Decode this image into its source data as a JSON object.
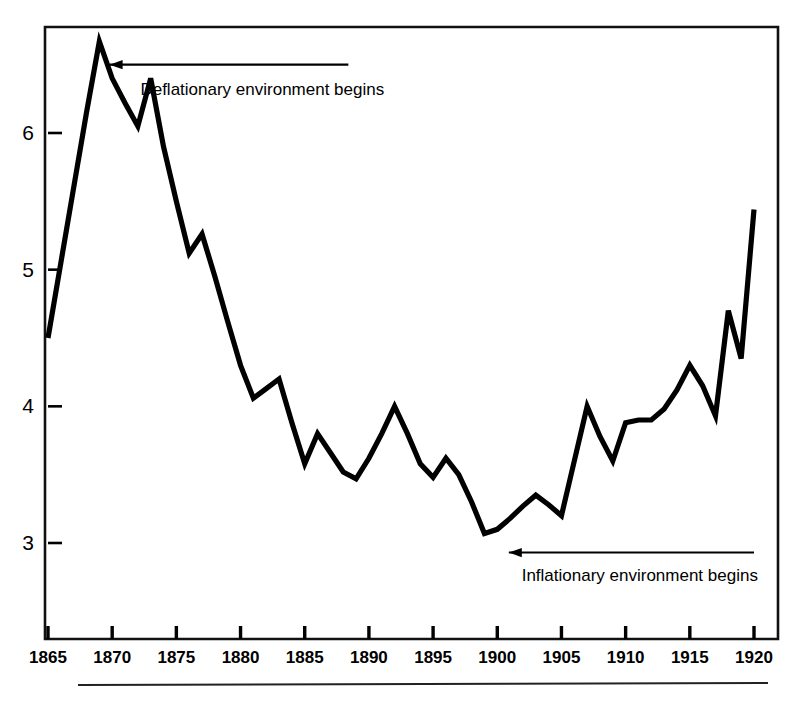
{
  "chart_data": {
    "type": "line",
    "title": "",
    "subtitle": "",
    "xlabel": "",
    "ylabel": "",
    "xlim": [
      1865,
      1920.5
    ],
    "ylim": [
      2.35,
      6.85
    ],
    "grid": false,
    "legend": "none",
    "line_color": "#000000",
    "x": [
      1865,
      1866,
      1867,
      1868,
      1869,
      1870,
      1871,
      1872,
      1873,
      1874,
      1875,
      1876,
      1877,
      1878,
      1879,
      1880,
      1881,
      1882,
      1883,
      1884,
      1885,
      1886,
      1887,
      1888,
      1889,
      1890,
      1891,
      1892,
      1893,
      1894,
      1895,
      1896,
      1897,
      1898,
      1899,
      1900,
      1901,
      1902,
      1903,
      1904,
      1905,
      1906,
      1907,
      1908,
      1909,
      1910,
      1911,
      1912,
      1913,
      1914,
      1915,
      1916,
      1917,
      1918,
      1919,
      1920
    ],
    "y": [
      4.5,
      5.05,
      5.6,
      6.15,
      6.67,
      6.4,
      6.22,
      6.05,
      6.4,
      5.9,
      5.5,
      5.12,
      5.26,
      4.95,
      4.62,
      4.3,
      4.06,
      4.13,
      4.2,
      3.88,
      3.58,
      3.8,
      3.66,
      3.52,
      3.47,
      3.62,
      3.8,
      4.0,
      3.8,
      3.58,
      3.48,
      3.62,
      3.5,
      3.3,
      3.07,
      3.1,
      3.18,
      3.27,
      3.35,
      3.28,
      3.2,
      3.6,
      4.0,
      3.78,
      3.6,
      3.88,
      3.9,
      3.9,
      3.98,
      4.12,
      4.3,
      4.15,
      3.93,
      4.7,
      4.35,
      5.44
    ],
    "xticks": [
      1865,
      1870,
      1875,
      1880,
      1885,
      1890,
      1895,
      1900,
      1905,
      1910,
      1915,
      1920
    ],
    "xtick_labels": [
      "1865",
      "1870",
      "1875",
      "1880",
      "1885",
      "1890",
      "1895",
      "1900",
      "1905",
      "1910",
      "1915",
      "1920"
    ],
    "yticks": [
      3,
      4,
      5,
      6
    ],
    "ytick_labels": [
      "3",
      "4",
      "5",
      "6"
    ],
    "annotations": [
      {
        "id": "deflation",
        "text": "Deflationary environment begins",
        "arrow_from_year": 1888.4,
        "arrow_to_year": 1869.8,
        "arrow_value": 6.5,
        "text_year": 1872.2,
        "text_value": 6.28
      },
      {
        "id": "inflation",
        "text": "Inflationary environment begins",
        "arrow_from_year": 1920.0,
        "arrow_to_year": 1900.9,
        "arrow_value": 2.93,
        "text_year": 1901.9,
        "text_value": 2.72
      }
    ]
  },
  "figure": {
    "frame_color": "#111111",
    "background": "#ffffff",
    "footer_rule": true
  }
}
